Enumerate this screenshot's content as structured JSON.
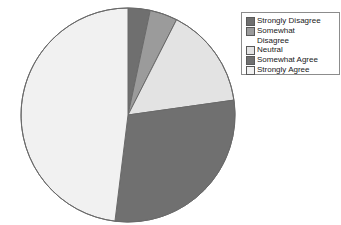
{
  "chart_data": {
    "type": "pie",
    "title": "",
    "subtitle": "",
    "xlabel": "",
    "ylabel": "",
    "grid": false,
    "legend_position": "top-right",
    "start_angle_deg": 90,
    "direction": "clockwise",
    "categories": [
      "Strongly Disagree",
      "Somewhat Disagree",
      "Neutral",
      "Somewhat Agree",
      "Strongly Agree"
    ],
    "values": [
      3.3,
      4.2,
      15.3,
      29.2,
      48.0
    ],
    "value_unit": "percent",
    "slice_angles_deg": [
      12,
      15,
      55,
      105,
      173
    ],
    "colors": [
      "#6f6f6f",
      "#9b9b9b",
      "#e3e3e3",
      "#707070",
      "#f1f1f1"
    ],
    "slices": [
      {
        "label": "Strongly Disagree",
        "value": 3.3,
        "angle_deg": 12,
        "color": "#6f6f6f"
      },
      {
        "label": "Somewhat Disagree",
        "value": 4.2,
        "angle_deg": 15,
        "color": "#9b9b9b"
      },
      {
        "label": "Neutral",
        "value": 15.3,
        "angle_deg": 55,
        "color": "#e3e3e3"
      },
      {
        "label": "Somewhat Agree",
        "value": 29.2,
        "angle_deg": 105,
        "color": "#707070"
      },
      {
        "label": "Strongly Agree",
        "value": 48.0,
        "angle_deg": 173,
        "color": "#f1f1f1"
      }
    ],
    "geometry": {
      "cx": 128,
      "cy": 115,
      "r": 107
    },
    "edge_color": "#6a6a6a"
  },
  "legend": {
    "border_color": "#8c8c8c",
    "items": [
      {
        "label": "Strongly Disagree",
        "color": "#6f6f6f"
      },
      {
        "label": "Somewhat\nDisagree",
        "color": "#9b9b9b"
      },
      {
        "label": "Neutral",
        "color": "#e3e3e3"
      },
      {
        "label": "Somewhat Agree",
        "color": "#707070"
      },
      {
        "label": "Strongly Agree",
        "color": "#f1f1f1"
      }
    ]
  }
}
